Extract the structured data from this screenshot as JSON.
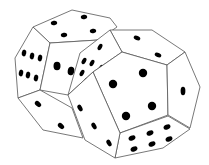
{
  "image": {
    "subject": "two dodecahedral dice",
    "background": "#ffffff",
    "line_color": "#555555",
    "pip_color": "#000000"
  },
  "dice": [
    {
      "name": "back-die",
      "faces": [
        {
          "name": "top",
          "pips": 4,
          "points": "33,27 72,10 110,18 117,27 98,40 50,43",
          "pip_coords": [
            [
              54,
              23,
              3.2,
              2.2,
              -10
            ],
            [
              84,
              17,
              3.2,
              2.2,
              -10
            ],
            [
              64,
              35,
              3.2,
              2.2,
              -10
            ],
            [
              93,
              31,
              3.2,
              2.2,
              -10
            ]
          ]
        },
        {
          "name": "left",
          "pips": 6,
          "points": "33,27 50,43 40,90 18,98 15,58",
          "pip_coords": [
            [
              24,
              53,
              2.2,
              3.4,
              10
            ],
            [
              32,
              56,
              2.2,
              3.4,
              10
            ],
            [
              40,
              58,
              2.2,
              3.4,
              10
            ],
            [
              21,
              73,
              2.2,
              3.4,
              10
            ],
            [
              28,
              75,
              2.2,
              3.4,
              10
            ],
            [
              36,
              78,
              2.2,
              3.4,
              10
            ]
          ]
        },
        {
          "name": "front-partial",
          "pips": 2,
          "points": "50,43 98,40 100,55 93,72 68,95 40,90",
          "pip_coords": [
            [
              57,
              66,
              3.5,
              4.2,
              0
            ],
            [
              71,
              71,
              3.3,
              4.2,
              10
            ]
          ]
        },
        {
          "name": "bottom-left",
          "pips": 2,
          "points": "18,98 40,90 72,108 83,138 43,130",
          "pip_coords": [
            [
              38,
              104,
              2.4,
              3.6,
              -50
            ],
            [
              61,
              126,
              2.4,
              3.6,
              -50
            ]
          ]
        }
      ]
    },
    {
      "name": "front-die",
      "faces": [
        {
          "name": "top",
          "pips": 2,
          "points": "110,30 152,30 185,52 167,65 122,52",
          "pip_coords": [
            [
              137,
              38,
              2.2,
              3.4,
              -70
            ],
            [
              158,
              55,
              2.2,
              3.4,
              -70
            ]
          ]
        },
        {
          "name": "left-upper",
          "pips": 6,
          "points": "110,30 122,52 93,72 68,95 80,53",
          "pip_coords": [
            [
              100,
              47,
              2.0,
              3.4,
              30
            ],
            [
              84,
              61,
              2.0,
              3.4,
              30
            ],
            [
              92,
              63,
              2.0,
              3.4,
              30
            ],
            [
              101,
              68,
              2.0,
              3.4,
              30
            ],
            [
              82,
              73,
              2.0,
              3.4,
              30
            ],
            [
              86,
              81,
              2.0,
              3.4,
              30
            ]
          ]
        },
        {
          "name": "center",
          "pips": 5,
          "points": "122,52 167,65 168,115 120,133 93,72",
          "pip_coords": [
            [
              143,
              73,
              4.2,
              4.2,
              0
            ],
            [
              113,
              84,
              4.2,
              4.2,
              0
            ],
            [
              152,
              106,
              4.2,
              4.2,
              0
            ],
            [
              126,
              116,
              4.2,
              4.2,
              0
            ]
          ]
        },
        {
          "name": "right",
          "pips": 1,
          "points": "185,52 200,87 190,128 168,115 167,65",
          "pip_coords": [
            [
              183,
              91,
              2.4,
              4.2,
              0
            ]
          ]
        },
        {
          "name": "bottom-right",
          "pips": 6,
          "points": "120,133 168,116 190,129 163,148 115,158",
          "pip_coords": [
            [
              132,
              138,
              3.6,
              2.4,
              -25
            ],
            [
              150,
              133,
              3.6,
              2.4,
              -25
            ],
            [
              167,
              127,
              3.6,
              2.4,
              -25
            ],
            [
              134,
              149,
              3.6,
              2.4,
              -25
            ],
            [
              152,
              144,
              3.6,
              2.4,
              -25
            ],
            [
              169,
              139,
              3.6,
              2.4,
              -25
            ]
          ]
        },
        {
          "name": "bottom-left",
          "pips": 3,
          "points": "68,95 93,72 120,133 115,158 85,140",
          "pip_coords": [
            [
              80,
              108,
              2.2,
              3.6,
              -30
            ],
            [
              94,
              126,
              2.2,
              3.6,
              -30
            ],
            [
              109,
              143,
              2.2,
              3.6,
              -30
            ]
          ]
        }
      ]
    }
  ]
}
